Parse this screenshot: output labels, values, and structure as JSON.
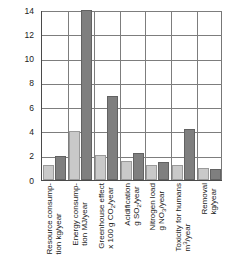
{
  "chart_data": {
    "type": "bar",
    "title": "",
    "xlabel": "",
    "ylabel": "",
    "ylim": [
      0,
      14
    ],
    "yticks": [
      0,
      2,
      4,
      6,
      8,
      10,
      12,
      14
    ],
    "grid": true,
    "legend": "none",
    "categories": [
      "Resource consumption kg/year",
      "Energy consumption MJ/year",
      "Greenhouse effect x 100 g CO2/year",
      "Acidification g SO2/year",
      "Nitrogen load g NO3/year",
      "Toxicity for humans m3/year",
      "Removal kg/year"
    ],
    "category_lines": [
      {
        "line1": "Resource consump-",
        "line2": "tion kg/year"
      },
      {
        "line1": "Energy consump-",
        "line2": "tion MJ/year"
      },
      {
        "line1": "Greenhouse effect",
        "line2": "x 100 g CO",
        "sub2": "2",
        "line2b": "/year"
      },
      {
        "line1": "Acidification",
        "line2": "g SO",
        "sub2": "2",
        "line2b": "/year"
      },
      {
        "line1": "Nitrogen load",
        "line2": "g NO",
        "sub2": "3",
        "line2b": "/year"
      },
      {
        "line1": "Toxicity for humans",
        "line2": "m",
        "sup2": "3",
        "line2b": "/year"
      },
      {
        "line1": "Removal",
        "line2": "kg/year"
      }
    ],
    "series": [
      {
        "name": "series-light",
        "color": "#c9c9c9",
        "values": [
          1.2,
          4.05,
          2.1,
          1.6,
          1.2,
          1.25,
          1.0
        ]
      },
      {
        "name": "series-dark",
        "color": "#7f7f7f",
        "values": [
          2.0,
          14.0,
          6.9,
          2.2,
          1.5,
          4.2,
          0.9
        ]
      }
    ]
  }
}
